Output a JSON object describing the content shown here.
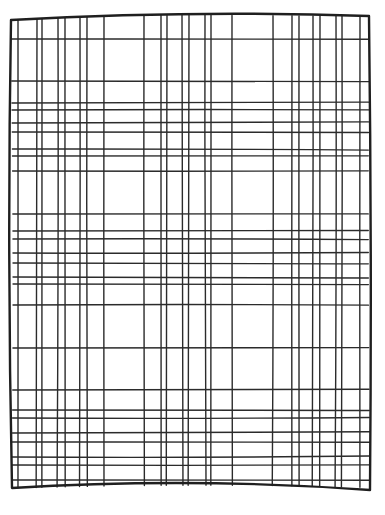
{
  "canvas": {
    "width": 385,
    "height": 515,
    "background": "#ffffff",
    "ink_color": "#2b2b2b",
    "border_color": "#1f1f1f"
  },
  "grid": {
    "style": "hand-drawn plaid grid",
    "border": {
      "top_left": [
        11,
        20
      ],
      "top_right": [
        369,
        16
      ],
      "bottom_right": [
        370,
        490
      ],
      "bottom_left": [
        12,
        488
      ],
      "top_mid_y": 15,
      "bottom_mid_y": 483
    },
    "vertical_lines_x": [
      18,
      37,
      42,
      58,
      65,
      80,
      87,
      104,
      144,
      161,
      167,
      182,
      189,
      205,
      211,
      232,
      273,
      292,
      299,
      313,
      320,
      336,
      342,
      360
    ],
    "horizontal_lines_y": [
      39,
      81,
      103,
      110,
      123,
      132,
      149,
      156,
      171,
      214,
      231,
      239,
      253,
      263,
      277,
      284,
      305,
      348,
      390,
      410,
      418,
      433,
      442,
      457,
      465,
      480
    ]
  }
}
